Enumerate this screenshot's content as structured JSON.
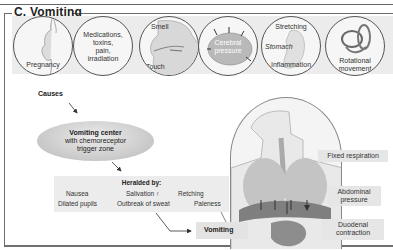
{
  "section": {
    "title": "C. Vomiting"
  },
  "causes": {
    "label": "Causes",
    "items": [
      {
        "id": "pregnancy",
        "label": "Pregnancy",
        "icon": "pregnant-woman-icon"
      },
      {
        "id": "medications",
        "label": "Medications, toxins, pain, irradiation",
        "lines": [
          "Medications,",
          "toxins,",
          "pain,",
          "irradiation"
        ]
      },
      {
        "id": "smell-touch",
        "labels": [
          "Smell",
          "Touch"
        ],
        "icon": "head-section-icon"
      },
      {
        "id": "cerebral-pressure",
        "labels": [
          "Cerebral",
          "pressure"
        ],
        "icon": "brain-icon"
      },
      {
        "id": "stomach",
        "labels": [
          "Stretching",
          "Stomach",
          "Inflammation"
        ],
        "icon": "stomach-icon"
      },
      {
        "id": "rotational",
        "labels": [
          "Rotational",
          "movement"
        ],
        "icon": "inner-ear-icon"
      }
    ]
  },
  "center": {
    "title": "Vomiting center",
    "subtitle_1": "with chemoreceptor",
    "subtitle_2": "trigger zone"
  },
  "heralded": {
    "title": "Heralded by:",
    "items": [
      "Nausea",
      "Salivation ↑",
      "Retching",
      "Dilated pupils",
      "Outbreak of sweat",
      "Paleness"
    ]
  },
  "outcome": {
    "label": "Vomiting"
  },
  "mechanisms": {
    "fixed_respiration": "Fixed respiration",
    "abdominal_1": "Abdominal",
    "abdominal_2": "pressure",
    "duodenal_1": "Duodenal",
    "duodenal_2": "contraction"
  },
  "colors": {
    "panel_bg": "#ececec",
    "frame": "#6e6e6e",
    "organ": "#9a9a9a"
  }
}
